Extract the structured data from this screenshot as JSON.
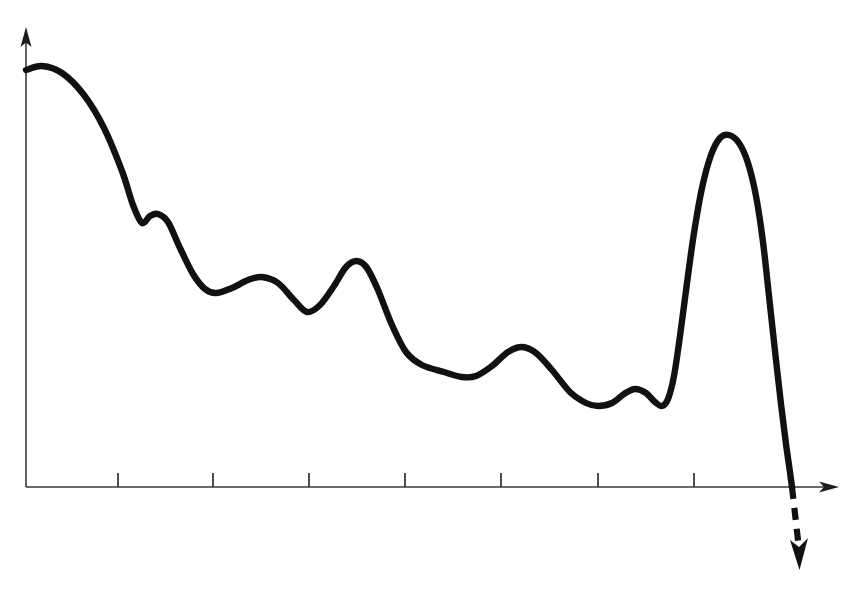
{
  "figure": {
    "title": "",
    "background_color": "#ffffff",
    "width": 856,
    "height": 596
  },
  "axes": {
    "y_axis": {
      "name": "vertical-axis",
      "label": "",
      "x": 26,
      "y_top": 28,
      "y_bottom": 487,
      "color": "#3a3a3a",
      "arrow": "up"
    },
    "x_axis": {
      "name": "horizontal-axis",
      "label": "",
      "x_left": 26,
      "x_right": 838,
      "y": 487,
      "color": "#3a3a3a",
      "arrow": "right"
    },
    "tick_marks": {
      "count": 7,
      "positions_x": [
        118,
        213,
        309,
        405,
        501,
        598,
        694
      ],
      "length": 14,
      "direction": "up",
      "labels": []
    }
  },
  "curve": {
    "name": "decaying-oscillation-curve",
    "color": "#111111",
    "stroke_width": 6.4,
    "style": "solid",
    "description": "Descending wavy curve with local bumps and a tall narrow peak near the right end, then a steep drop through the axis"
  },
  "projection": {
    "name": "dashed-downward-continuation",
    "color": "#111111",
    "style": "dashed",
    "dash_pattern": "12 9",
    "from_x": 792,
    "from_y": 487,
    "to_x": 799,
    "to_y": 556,
    "arrow": "down"
  },
  "chart_data": {
    "type": "line",
    "title": "",
    "xlabel": "",
    "ylabel": "",
    "grid": false,
    "legend": null,
    "axis_arrows": {
      "x": "right",
      "y": "up"
    },
    "xlim": [
      26,
      838
    ],
    "ylim": [
      487,
      28
    ],
    "x_tick_positions": [
      118,
      213,
      309,
      405,
      501,
      598,
      694
    ],
    "x_tick_labels": [],
    "y_tick_labels": [],
    "series": [
      {
        "name": "main-curve",
        "points_px": [
          [
            26,
            70
          ],
          [
            42,
            66
          ],
          [
            62,
            73
          ],
          [
            84,
            95
          ],
          [
            104,
            128
          ],
          [
            122,
            171
          ],
          [
            133,
            205
          ],
          [
            142,
            223
          ],
          [
            150,
            216
          ],
          [
            158,
            214
          ],
          [
            168,
            222
          ],
          [
            180,
            248
          ],
          [
            193,
            274
          ],
          [
            205,
            289
          ],
          [
            216,
            293
          ],
          [
            232,
            288
          ],
          [
            248,
            280
          ],
          [
            262,
            277
          ],
          [
            278,
            283
          ],
          [
            294,
            300
          ],
          [
            307,
            312
          ],
          [
            320,
            305
          ],
          [
            334,
            286
          ],
          [
            346,
            267
          ],
          [
            357,
            261
          ],
          [
            367,
            268
          ],
          [
            378,
            290
          ],
          [
            392,
            325
          ],
          [
            406,
            352
          ],
          [
            422,
            365
          ],
          [
            444,
            372
          ],
          [
            462,
            377
          ],
          [
            476,
            376
          ],
          [
            492,
            366
          ],
          [
            508,
            352
          ],
          [
            522,
            347
          ],
          [
            536,
            353
          ],
          [
            552,
            370
          ],
          [
            570,
            392
          ],
          [
            586,
            403
          ],
          [
            598,
            406
          ],
          [
            612,
            403
          ],
          [
            624,
            394
          ],
          [
            635,
            389
          ],
          [
            646,
            393
          ],
          [
            655,
            402
          ],
          [
            662,
            406
          ],
          [
            668,
            399
          ],
          [
            674,
            376
          ],
          [
            680,
            336
          ],
          [
            687,
            283
          ],
          [
            694,
            233
          ],
          [
            702,
            188
          ],
          [
            711,
            155
          ],
          [
            720,
            138
          ],
          [
            729,
            135
          ],
          [
            739,
            143
          ],
          [
            748,
            163
          ],
          [
            756,
            196
          ],
          [
            763,
            242
          ],
          [
            769,
            296
          ],
          [
            775,
            351
          ],
          [
            781,
            404
          ],
          [
            786,
            444
          ],
          [
            790,
            472
          ],
          [
            792,
            487
          ]
        ],
        "key_features": [
          {
            "label": "initial-maximum",
            "x": 42,
            "y": 66
          },
          {
            "label": "first-shoulder-bump",
            "x": 155,
            "y": 214
          },
          {
            "label": "second-round-hump",
            "x": 262,
            "y": 277
          },
          {
            "label": "sharp-peak",
            "x": 357,
            "y": 261
          },
          {
            "label": "third-hump",
            "x": 522,
            "y": 347
          },
          {
            "label": "small-bump",
            "x": 635,
            "y": 389
          },
          {
            "label": "tall-narrow-peak",
            "x": 729,
            "y": 135
          },
          {
            "label": "axis-crossing",
            "x": 792,
            "y": 487
          }
        ]
      }
    ]
  }
}
